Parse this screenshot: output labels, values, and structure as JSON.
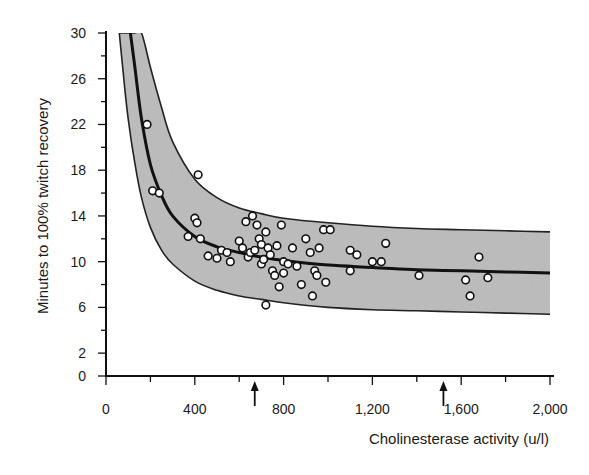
{
  "chart_data": {
    "type": "scatter",
    "title": "",
    "xlabel": "Cholinesterase activity (u/l)",
    "ylabel": "Minutes to 100% twitch recovery",
    "xlim": [
      0,
      2000
    ],
    "ylim": [
      0,
      30
    ],
    "x_ticks": [
      0,
      400,
      800,
      1200,
      1600,
      2000
    ],
    "x_tick_labels": [
      "0",
      "400",
      "800",
      "1,200",
      "1,600",
      "2,000"
    ],
    "x_minor_step": 200,
    "y_ticks": [
      0,
      2,
      6,
      10,
      14,
      18,
      22,
      26,
      30
    ],
    "y_tick_labels": [
      "0",
      "2",
      "6",
      "10",
      "14",
      "18",
      "22",
      "26",
      "30"
    ],
    "y_minor_step": 2,
    "grid": false,
    "legend": null,
    "annotations": [
      {
        "type": "arrow",
        "x": 670,
        "direction": "up",
        "position": "below x-axis"
      },
      {
        "type": "arrow",
        "x": 1520,
        "direction": "up",
        "position": "below x-axis"
      }
    ],
    "regression_curve": {
      "name": "fitted curve",
      "x": [
        110,
        130,
        160,
        200,
        250,
        300,
        400,
        500,
        600,
        700,
        800,
        1000,
        1200,
        1400,
        1600,
        1800,
        2000
      ],
      "y": [
        30,
        27,
        22.5,
        18.5,
        15.8,
        14.0,
        12.2,
        11.3,
        10.8,
        10.4,
        10.1,
        9.7,
        9.5,
        9.3,
        9.2,
        9.1,
        9.0
      ]
    },
    "confidence_band": {
      "name": "prediction band (shaded)",
      "x": [
        60,
        80,
        100,
        130,
        160,
        200,
        250,
        300,
        400,
        500,
        600,
        700,
        800,
        1000,
        1200,
        1400,
        1600,
        1800,
        2000
      ],
      "upper": [
        30,
        30,
        30,
        30,
        30,
        27,
        23.5,
        20.5,
        17.2,
        15.6,
        14.7,
        14.2,
        13.8,
        13.4,
        13.1,
        12.9,
        12.8,
        12.7,
        12.6
      ],
      "lower": [
        30,
        26,
        22.5,
        18.6,
        15.6,
        13.0,
        11.0,
        9.8,
        8.3,
        7.5,
        7.0,
        6.7,
        6.4,
        6.0,
        5.8,
        5.7,
        5.6,
        5.5,
        5.4
      ]
    },
    "series": [
      {
        "name": "patients",
        "points": [
          [
            185,
            22.0
          ],
          [
            210,
            16.2
          ],
          [
            240,
            16.0
          ],
          [
            415,
            17.6
          ],
          [
            370,
            12.2
          ],
          [
            400,
            13.8
          ],
          [
            410,
            13.4
          ],
          [
            425,
            12.0
          ],
          [
            460,
            10.5
          ],
          [
            500,
            10.3
          ],
          [
            520,
            11.0
          ],
          [
            545,
            10.8
          ],
          [
            560,
            10.0
          ],
          [
            600,
            11.8
          ],
          [
            615,
            11.2
          ],
          [
            630,
            13.5
          ],
          [
            640,
            10.4
          ],
          [
            650,
            10.8
          ],
          [
            660,
            14.0
          ],
          [
            670,
            11.0
          ],
          [
            680,
            13.2
          ],
          [
            690,
            12.0
          ],
          [
            700,
            11.5
          ],
          [
            700,
            9.8
          ],
          [
            710,
            10.2
          ],
          [
            720,
            12.6
          ],
          [
            730,
            11.2
          ],
          [
            740,
            10.6
          ],
          [
            750,
            9.2
          ],
          [
            760,
            8.8
          ],
          [
            770,
            11.4
          ],
          [
            780,
            7.8
          ],
          [
            790,
            13.2
          ],
          [
            800,
            10.0
          ],
          [
            800,
            9.0
          ],
          [
            820,
            9.8
          ],
          [
            840,
            11.2
          ],
          [
            860,
            9.6
          ],
          [
            880,
            8.0
          ],
          [
            900,
            12.0
          ],
          [
            920,
            10.8
          ],
          [
            930,
            7.0
          ],
          [
            940,
            9.2
          ],
          [
            950,
            8.8
          ],
          [
            960,
            11.2
          ],
          [
            980,
            12.8
          ],
          [
            990,
            8.2
          ],
          [
            1010,
            12.8
          ],
          [
            720,
            6.2
          ],
          [
            1100,
            11.0
          ],
          [
            1100,
            9.2
          ],
          [
            1130,
            10.6
          ],
          [
            1200,
            10.0
          ],
          [
            1240,
            10.0
          ],
          [
            1260,
            11.6
          ],
          [
            1410,
            8.8
          ],
          [
            1620,
            8.4
          ],
          [
            1640,
            7.0
          ],
          [
            1680,
            10.4
          ],
          [
            1720,
            8.6
          ]
        ]
      }
    ],
    "colors": {
      "band_fill": "#b8b8b8",
      "curve": "#111111",
      "marker_face": "#ffffff",
      "marker_edge": "#111111",
      "axis": "#111111"
    }
  }
}
